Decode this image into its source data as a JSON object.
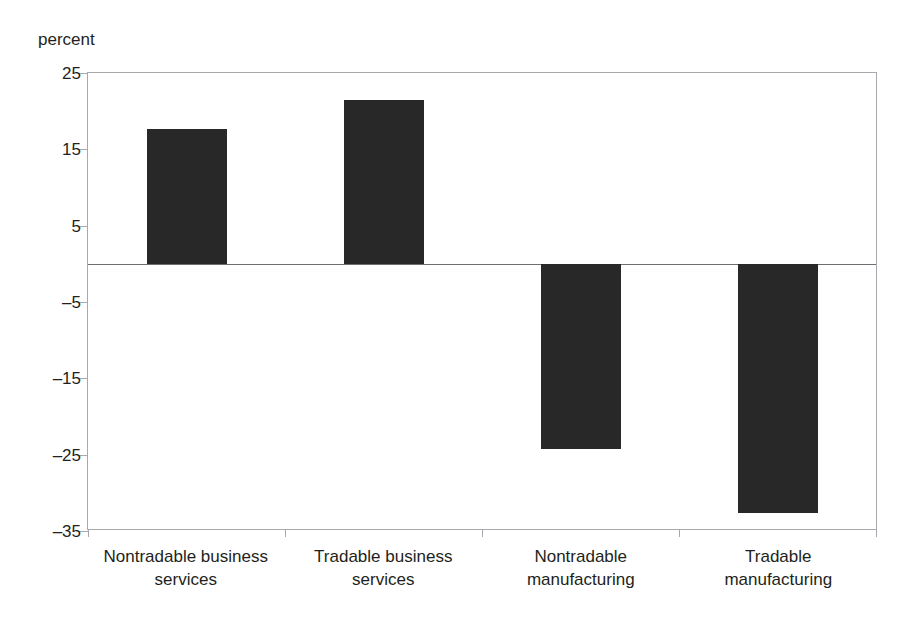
{
  "chart_data": {
    "type": "bar",
    "title": "",
    "subtitle": "",
    "xlabel": "",
    "ylabel": "percent",
    "unit_label": "percent",
    "categories": [
      "Nontradable business services",
      "Tradable business services",
      "Nontradable manufacturing",
      "Tradable manufacturing"
    ],
    "category_lines": [
      [
        "Nontradable business",
        "services"
      ],
      [
        "Tradable business",
        "services"
      ],
      [
        "Nontradable",
        "manufacturing"
      ],
      [
        "Tradable",
        "manufacturing"
      ]
    ],
    "values": [
      17.6,
      21.5,
      -24.2,
      -32.6
    ],
    "ylim": [
      -35,
      25
    ],
    "yticks": [
      25,
      15,
      5,
      -5,
      -15,
      -25,
      -35
    ],
    "ytick_labels": [
      "25",
      "15",
      "5",
      "–5",
      "–15",
      "–25",
      "–35"
    ],
    "grid": false,
    "legend": false,
    "zero_line": true,
    "colors": {
      "bar": "#282828",
      "axis": "#a7a9ac",
      "zero_line": "#6d6e71",
      "text": "#231f20",
      "background": "#ffffff"
    }
  }
}
